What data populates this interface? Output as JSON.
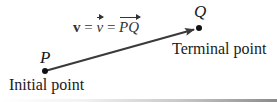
{
  "diagram": {
    "equation": {
      "bold_v": "v",
      "eq1": " = ",
      "arrow_v": "v",
      "eq2": " = ",
      "pq": "PQ"
    },
    "points": {
      "initial": {
        "name": "P",
        "caption": "Initial point",
        "x": 45,
        "y": 71
      },
      "terminal": {
        "name": "Q",
        "caption": "Terminal point",
        "x": 199,
        "y": 28
      }
    },
    "colors": {
      "line": "#3a3a3a",
      "point": "#111111",
      "text": "#1a1a1a"
    }
  }
}
